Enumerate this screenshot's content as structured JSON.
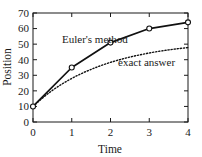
{
  "chart_data": {
    "type": "line",
    "title": "",
    "subtitle": "",
    "xlabel": "Time",
    "ylabel": "Position",
    "xlim": [
      0,
      4
    ],
    "ylim": [
      0,
      70
    ],
    "xticks": [
      "0",
      "1",
      "2",
      "3",
      "4"
    ],
    "xtick_values": [
      0,
      1,
      2,
      3,
      4
    ],
    "yticks": [
      "0",
      "10",
      "20",
      "30",
      "40",
      "50",
      "60",
      "70"
    ],
    "ytick_values": [
      0,
      10,
      20,
      30,
      40,
      50,
      60,
      70
    ],
    "grid": false,
    "legend_position": "inline-annotations",
    "frame": "box",
    "tick_direction": "in",
    "series": [
      {
        "name": "Euler's method",
        "style": "solid",
        "marker": "open-circle",
        "color": "#111111",
        "x": [
          0,
          1,
          2,
          3,
          4
        ],
        "values": [
          10,
          35,
          51,
          60,
          64
        ]
      },
      {
        "name": "exact answer",
        "style": "dotted",
        "marker": "none",
        "color": "#111111",
        "x": [
          0,
          0.25,
          0.5,
          0.75,
          1,
          1.25,
          1.5,
          1.75,
          2,
          2.25,
          2.5,
          2.75,
          3,
          3.25,
          3.5,
          3.75,
          4
        ],
        "values": [
          10,
          15.5,
          20.3,
          24.4,
          28.0,
          31.1,
          33.8,
          36.2,
          38.3,
          40.1,
          41.7,
          43.1,
          44.3,
          45.4,
          46.3,
          47.1,
          47.8
        ]
      }
    ],
    "annotations": [
      {
        "text": "Euler's method",
        "x_px": 62,
        "y_px": 43
      },
      {
        "text": "exact answer",
        "x_px": 118,
        "y_px": 66
      }
    ]
  }
}
